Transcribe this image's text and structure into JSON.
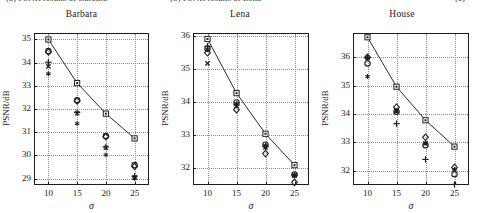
{
  "figure": {
    "cut_off_caption_fragments": [
      {
        "text": "(a)  PSNR  results  of  Barbara",
        "x": 6
      },
      {
        "text": "(b)  PSNR  results  of  Lena",
        "x": 170
      },
      {
        "text": "(c)",
        "x": 455
      }
    ]
  },
  "axis_common": {
    "xlabel": "σ",
    "ylabel": "PSNR/dB",
    "xticks": [
      "10",
      "15",
      "20",
      "25"
    ],
    "x_values": [
      10,
      15,
      20,
      25
    ],
    "xlim": [
      7.5,
      27.5
    ]
  },
  "chart_data": [
    {
      "type": "line",
      "title": "Barbara",
      "xlabel": "σ",
      "ylabel": "PSNR/dB",
      "x": [
        10,
        15,
        20,
        25
      ],
      "xticks": [
        "10",
        "15",
        "20",
        "25"
      ],
      "yticks": [
        "29",
        "30",
        "31",
        "32",
        "33",
        "34",
        "35"
      ],
      "ylim": [
        28.72,
        35.28
      ],
      "xlim": [
        7.5,
        27.5
      ],
      "grid": true,
      "legend": "none",
      "series": [
        {
          "name": "proposed",
          "marker": "square",
          "connected": true,
          "values": [
            35.0,
            33.12,
            31.8,
            30.73
          ]
        },
        {
          "name": "method-2",
          "marker": "circle",
          "connected": false,
          "values": [
            34.5,
            32.38,
            30.83,
            29.58
          ]
        },
        {
          "name": "method-3",
          "marker": "diamond",
          "connected": false,
          "values": [
            34.46,
            32.35,
            30.8,
            29.52
          ]
        },
        {
          "name": "method-4",
          "marker": "plus",
          "connected": false,
          "values": [
            34.02,
            31.85,
            30.36,
            29.1
          ]
        },
        {
          "name": "method-5",
          "marker": "cross",
          "connected": false,
          "values": [
            33.84,
            31.82,
            30.33,
            29.05
          ]
        },
        {
          "name": "method-6",
          "marker": "star",
          "connected": false,
          "values": [
            33.52,
            31.37,
            30.02,
            29.0
          ]
        }
      ]
    },
    {
      "type": "line",
      "title": "Lena",
      "xlabel": "σ",
      "ylabel": "PSNR/dB",
      "x": [
        10,
        15,
        20,
        25
      ],
      "xticks": [
        "10",
        "15",
        "20",
        "25"
      ],
      "yticks": [
        "32",
        "33",
        "34",
        "35",
        "36"
      ],
      "ylim": [
        31.5,
        36.1
      ],
      "xlim": [
        7.5,
        27.5
      ],
      "grid": true,
      "legend": "none",
      "series": [
        {
          "name": "proposed",
          "marker": "square",
          "connected": true,
          "values": [
            35.92,
            34.28,
            33.05,
            32.1
          ]
        },
        {
          "name": "method-2",
          "marker": "circle",
          "connected": false,
          "values": [
            35.62,
            34.0,
            32.72,
            31.82
          ]
        },
        {
          "name": "method-3",
          "marker": "diamond",
          "connected": false,
          "values": [
            35.5,
            33.78,
            32.45,
            31.58
          ]
        },
        {
          "name": "method-4",
          "marker": "plus",
          "connected": false,
          "values": [
            35.7,
            33.92,
            32.66,
            31.8
          ]
        },
        {
          "name": "method-5",
          "marker": "cross",
          "connected": false,
          "values": [
            35.18,
            33.9,
            32.64,
            31.78
          ]
        },
        {
          "name": "method-6",
          "marker": "star",
          "connected": false,
          "values": [
            35.6,
            33.96,
            32.7,
            31.81
          ]
        }
      ]
    },
    {
      "type": "line",
      "title": "House",
      "xlabel": "σ",
      "ylabel": "PSNR/dB",
      "x": [
        10,
        15,
        20,
        25
      ],
      "xticks": [
        "10",
        "15",
        "20",
        "25"
      ],
      "yticks": [
        "32",
        "33",
        "34",
        "35",
        "36"
      ],
      "ylim": [
        31.5,
        36.85
      ],
      "xlim": [
        7.5,
        27.5
      ],
      "grid": true,
      "legend": "none",
      "series": [
        {
          "name": "proposed",
          "marker": "square",
          "connected": true,
          "values": [
            36.7,
            34.96,
            33.78,
            32.85
          ]
        },
        {
          "name": "method-2",
          "marker": "circle",
          "connected": false,
          "values": [
            35.78,
            34.08,
            32.9,
            31.88
          ]
        },
        {
          "name": "method-3",
          "marker": "diamond",
          "connected": false,
          "values": [
            36.0,
            34.24,
            33.18,
            32.12
          ]
        },
        {
          "name": "method-4",
          "marker": "plus",
          "connected": false,
          "values": [
            35.98,
            33.66,
            32.4,
            31.52
          ]
        },
        {
          "name": "method-5",
          "marker": "cross",
          "connected": false,
          "values": [
            35.97,
            34.1,
            32.96,
            32.0
          ]
        },
        {
          "name": "method-6",
          "marker": "star",
          "connected": false,
          "values": [
            35.32,
            34.12,
            32.98,
            32.05
          ]
        }
      ]
    }
  ],
  "panel_geometry": [
    {
      "left": 4,
      "width": 155,
      "plot_left": 34,
      "plot_top": 24,
      "plot_width": 115,
      "plot_height": 152
    },
    {
      "left": 161,
      "width": 158,
      "plot_left": 193,
      "plot_top": 24,
      "plot_width": 116,
      "plot_height": 152
    },
    {
      "left": 321,
      "width": 162,
      "plot_left": 353,
      "plot_top": 24,
      "plot_width": 116,
      "plot_height": 152
    }
  ]
}
